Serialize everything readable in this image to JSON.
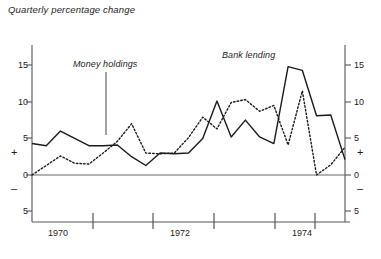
{
  "title": "Quarterly percentage change",
  "annotations": {
    "money_holdings": "Money holdings",
    "bank_lending": "Bank lending"
  },
  "axis": {
    "y_left_ticks": [
      "15",
      "10",
      "5",
      "0",
      "5"
    ],
    "y_right_ticks": [
      "15",
      "10",
      "5",
      "0",
      "5"
    ],
    "plus_sign": "+",
    "minus_sign": "–",
    "x_ticks": [
      "1970",
      "1972",
      "1974"
    ]
  },
  "colors": {
    "line": "#1a1a1a",
    "axis": "#555555",
    "background": "#ffffff"
  },
  "chart_data": {
    "type": "line",
    "title": "Quarterly percentage change",
    "xlabel": "",
    "ylabel": "",
    "ylim": [
      -5,
      17.5
    ],
    "yticks": [
      -5,
      0,
      5,
      10,
      15
    ],
    "grid": false,
    "legend": "inline annotations",
    "x": [
      1969.5,
      1969.75,
      1970.0,
      1970.25,
      1970.5,
      1970.75,
      1971.0,
      1971.25,
      1971.5,
      1971.75,
      1972.0,
      1972.25,
      1972.5,
      1972.75,
      1973.0,
      1973.25,
      1973.5,
      1973.75,
      1974.0,
      1974.25,
      1974.5,
      1974.75,
      1975.0
    ],
    "series": [
      {
        "name": "Bank lending",
        "style": "solid",
        "values": [
          4.3,
          4.0,
          6.0,
          5.0,
          4.0,
          4.0,
          4.1,
          2.5,
          1.3,
          3.0,
          2.9,
          3.0,
          5.0,
          10.1,
          5.2,
          7.5,
          5.2,
          4.3,
          14.8,
          14.3,
          8.1,
          8.2,
          2.1
        ]
      },
      {
        "name": "Money holdings",
        "style": "dotted",
        "values": [
          0.0,
          1.3,
          2.6,
          1.6,
          1.5,
          3.0,
          4.6,
          7.0,
          3.0,
          2.9,
          3.0,
          5.1,
          7.9,
          6.3,
          9.9,
          10.3,
          8.7,
          9.5,
          4.1,
          11.5,
          0.0,
          1.4,
          3.8
        ]
      }
    ]
  }
}
